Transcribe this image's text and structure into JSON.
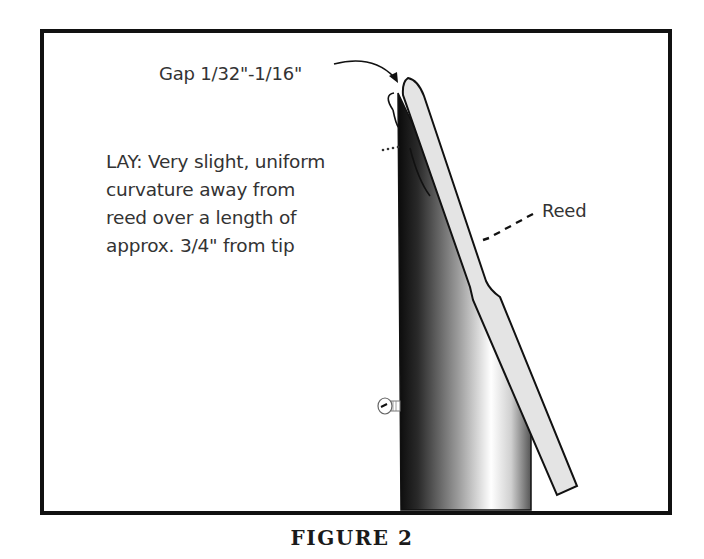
{
  "figure": {
    "caption": "FIGURE 2",
    "labels": {
      "gap": "Gap 1/32\"-1/16\"",
      "lay_lines": [
        "LAY: Very slight, uniform",
        "curvature away from",
        "reed over a length of",
        "approx. 3/4\" from tip"
      ],
      "reed": "Reed"
    },
    "parts": {
      "mouthpiece": "mouthpiece-body",
      "reed": "reed",
      "screw": "ligature-screw"
    },
    "colors": {
      "frame": "#111111",
      "reed_fill": "#e4e4e4",
      "outline": "#111111",
      "text": "#333333"
    }
  }
}
